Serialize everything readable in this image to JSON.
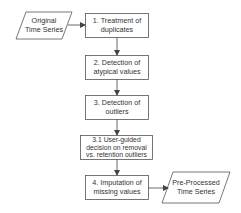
{
  "diagram": {
    "type": "flowchart",
    "colors": {
      "stroke": "#555555",
      "text": "#333333",
      "background": "#ffffff"
    },
    "input": {
      "line1": "Original",
      "line2": "Time Series"
    },
    "steps": [
      {
        "id": "1",
        "line1": "1. Treatment of",
        "line2": "duplicates"
      },
      {
        "id": "2",
        "line1": "2. Detection of",
        "line2": "atypical values"
      },
      {
        "id": "3",
        "line1": "3. Detection of",
        "line2": "outliers"
      },
      {
        "id": "3.1",
        "line1": "3.1 User-guided",
        "line2": "decision on removal",
        "line3": "vs. retention outliers"
      },
      {
        "id": "4",
        "line1": "4. Imputation of",
        "line2": "missing values"
      }
    ],
    "output": {
      "line1": "Pre-Processed",
      "line2": "Time Series"
    },
    "edges": [
      {
        "from": "input",
        "to": "1"
      },
      {
        "from": "1",
        "to": "2"
      },
      {
        "from": "2",
        "to": "3"
      },
      {
        "from": "3",
        "to": "3.1"
      },
      {
        "from": "3.1",
        "to": "4"
      },
      {
        "from": "4",
        "to": "output"
      }
    ]
  }
}
